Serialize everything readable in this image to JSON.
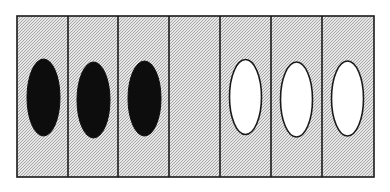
{
  "figure": {
    "panel": {
      "x": 17,
      "y": 16,
      "width": 357,
      "height": 161
    },
    "cell_fill": "#cfcfcf",
    "stipple_dark": "#a8a8a8",
    "stipple_light": "#e6e6e6",
    "border_color": "#1a1a1a",
    "cells": [
      {
        "index": 1,
        "x": 17,
        "width": 51,
        "content": "filled-ellipse"
      },
      {
        "index": 2,
        "x": 68,
        "width": 50,
        "content": "filled-ellipse"
      },
      {
        "index": 3,
        "x": 118,
        "width": 51,
        "content": "filled-ellipse"
      },
      {
        "index": 4,
        "x": 169,
        "width": 51,
        "content": "empty"
      },
      {
        "index": 5,
        "x": 220,
        "width": 51,
        "content": "open-ellipse"
      },
      {
        "index": 6,
        "x": 271,
        "width": 51,
        "content": "open-ellipse"
      },
      {
        "index": 7,
        "x": 322,
        "width": 52,
        "content": "open-ellipse"
      }
    ],
    "ellipses": [
      {
        "cell": 1,
        "cx": 43.5,
        "cy": 97.5,
        "rx": 16.5,
        "ry": 38.5,
        "fill": "#0d0d0d",
        "stroke": "#0d0d0d",
        "style": "filled"
      },
      {
        "cell": 2,
        "cx": 93.5,
        "cy": 100,
        "rx": 16.5,
        "ry": 38,
        "fill": "#0d0d0d",
        "stroke": "#0d0d0d",
        "style": "filled"
      },
      {
        "cell": 3,
        "cx": 144.5,
        "cy": 98.5,
        "rx": 16.5,
        "ry": 37.5,
        "fill": "#0d0d0d",
        "stroke": "#0d0d0d",
        "style": "filled"
      },
      {
        "cell": 5,
        "cx": 245.5,
        "cy": 97,
        "rx": 16,
        "ry": 37.5,
        "fill": "#ffffff",
        "stroke": "#1a1a1a",
        "style": "open"
      },
      {
        "cell": 6,
        "cx": 296.5,
        "cy": 99.5,
        "rx": 16,
        "ry": 37.5,
        "fill": "#ffffff",
        "stroke": "#1a1a1a",
        "style": "open"
      },
      {
        "cell": 7,
        "cx": 347.5,
        "cy": 98.5,
        "rx": 16,
        "ry": 37.5,
        "fill": "#ffffff",
        "stroke": "#1a1a1a",
        "style": "open"
      }
    ]
  }
}
